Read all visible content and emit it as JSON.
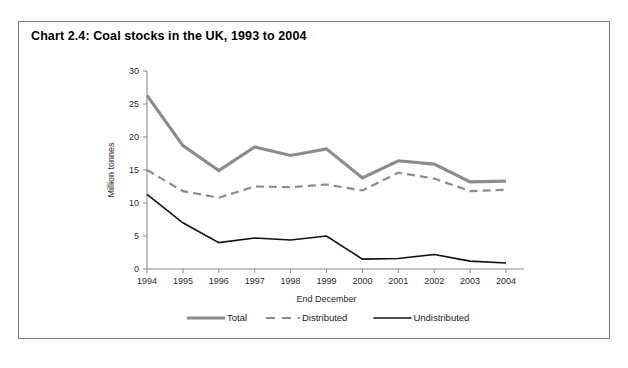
{
  "chart_title": "Chart 2.4: Coal stocks in the UK, 1993 to 2004",
  "axes": {
    "ylabel": "Million tonnes",
    "xlabel": "End December",
    "ytick_labels": [
      "0",
      "5",
      "10",
      "15",
      "20",
      "25",
      "30"
    ],
    "xtick_labels": [
      "1994",
      "1995",
      "1996",
      "1997",
      "1998",
      "1999",
      "2000",
      "2001",
      "2002",
      "2003",
      "2004"
    ]
  },
  "legend": {
    "items": [
      {
        "label": "Total",
        "color": "#8c8c8c",
        "style": "solid",
        "width": 3.2
      },
      {
        "label": "Distributed",
        "color": "#8c8c8c",
        "style": "dashed",
        "width": 2.2
      },
      {
        "label": "Undistributed",
        "color": "#111111",
        "style": "solid",
        "width": 1.6
      }
    ]
  },
  "chart_data": {
    "type": "line",
    "title": "Chart 2.4: Coal stocks in the UK, 1993 to 2004",
    "xlabel": "End December",
    "ylabel": "Million tonnes",
    "categories": [
      "1994",
      "1995",
      "1996",
      "1997",
      "1998",
      "1999",
      "2000",
      "2001",
      "2002",
      "2003",
      "2004"
    ],
    "xlim": [
      1994,
      2004
    ],
    "ylim": [
      0,
      30
    ],
    "ytick_step": 5,
    "grid": false,
    "legend_position": "bottom",
    "series": [
      {
        "name": "Total",
        "color": "#8c8c8c",
        "style": "solid",
        "values": [
          26.3,
          18.7,
          14.9,
          18.5,
          17.2,
          18.2,
          13.8,
          16.4,
          15.9,
          13.2,
          13.3
        ]
      },
      {
        "name": "Distributed",
        "color": "#8c8c8c",
        "style": "dashed",
        "values": [
          15.0,
          11.8,
          10.8,
          12.5,
          12.4,
          12.8,
          11.9,
          14.6,
          13.7,
          11.8,
          12.0
        ]
      },
      {
        "name": "Undistributed",
        "color": "#111111",
        "style": "solid",
        "values": [
          11.3,
          7.0,
          4.0,
          4.7,
          4.4,
          5.0,
          1.5,
          1.6,
          2.2,
          1.2,
          0.9
        ]
      }
    ]
  }
}
